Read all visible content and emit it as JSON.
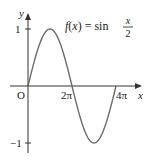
{
  "chart_data": {
    "type": "line",
    "function_label": {
      "lhs": "f(x) = sin",
      "num": "x",
      "den": "2"
    },
    "xlabel": "x",
    "ylabel": "y",
    "origin_label": "O",
    "x_ticks": [
      {
        "value": 6.2832,
        "label": "2π"
      },
      {
        "value": 12.5664,
        "label": "4π"
      }
    ],
    "y_ticks": [
      {
        "value": 1,
        "label": "1"
      },
      {
        "value": -1,
        "label": "−1"
      }
    ],
    "xlim": [
      0,
      12.5664
    ],
    "ylim": [
      -1,
      1
    ],
    "series": [
      {
        "name": "sin(x/2)",
        "x": [
          0,
          3.1416,
          6.2832,
          9.4248,
          12.5664
        ],
        "y": [
          0,
          1,
          0,
          -1,
          0
        ]
      }
    ],
    "grid": false,
    "line_color": "#6b6b6b",
    "axis_color": "#333333"
  }
}
